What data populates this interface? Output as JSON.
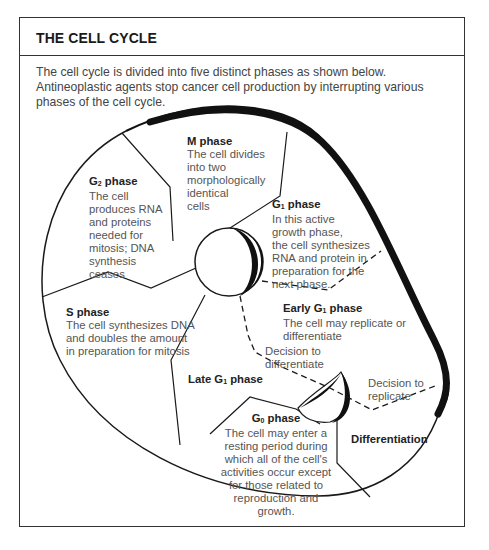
{
  "header": {
    "title": "THE CELL CYCLE"
  },
  "intro": "The cell cycle is divided into five distinct phases as shown below. Antineoplastic agents stop cancer cell production by interrupting various phases of the cell cycle.",
  "phases": {
    "m": {
      "title": "M phase",
      "body": "The cell divides\ninto two\nmorphologically\nidentical\ncells"
    },
    "g2": {
      "title_prefix": "G",
      "title_sub": "2",
      "title_suffix": " phase",
      "body": "The cell\nproduces RNA\nand proteins\nneeded for\nmitosis; DNA\nsynthesis\nceases"
    },
    "g1": {
      "title_prefix": "G",
      "title_sub": "1",
      "title_suffix": " phase",
      "body": "In this active\ngrowth phase,\nthe cell synthesizes\nRNA and protein in\npreparation for the\nnext phase."
    },
    "early_g1": {
      "title_prefix": "Early G",
      "title_sub": "1",
      "title_suffix": " phase",
      "body": "The cell may replicate or\ndifferentiate"
    },
    "s": {
      "title": "S phase",
      "body": "The cell synthesizes DNA\nand doubles the amount\nin preparation for mitosis"
    },
    "late_g1": {
      "title_prefix": "Late G",
      "title_sub": "1",
      "title_suffix": " phase"
    },
    "g0": {
      "title_prefix": "G",
      "title_sub": "0",
      "title_suffix": " phase",
      "body": "The cell may enter a\nresting period during\nwhich all of the cell's\nactivities occur except\nfor those related to\nreproduction and\ngrowth."
    },
    "differentiation": {
      "title": "Differentiation"
    }
  },
  "annotations": {
    "decision_differentiate": "Decision to\ndifferentiate",
    "decision_replicate": "Decision to\nreplicate"
  },
  "colors": {
    "line": "#1a1a1a",
    "border": "#333333",
    "text": "#555555",
    "heading": "#222222"
  }
}
